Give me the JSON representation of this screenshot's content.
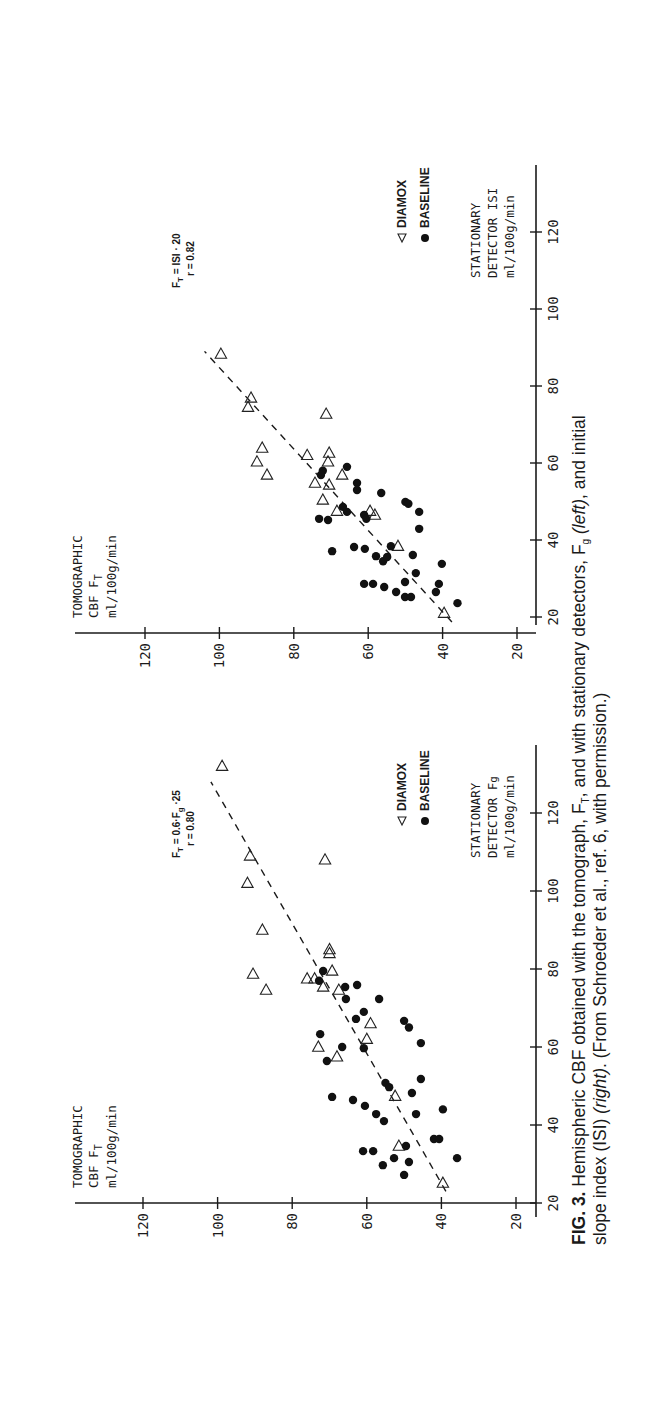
{
  "caption": {
    "fig_label": "FIG. 3.",
    "line1_a": " Hemispheric CBF obtained with the tomograph, F",
    "line1_sub_T": "T",
    "line1_b": ", and with stationary detectors, F",
    "line1_sub_g": "g",
    "line1_c": " ",
    "line1_left": "(left)",
    "line1_d": ", and initial",
    "line2_a": "slope index (ISI) ",
    "line2_right": "(right)",
    "line2_b": ". (From Schroeder et al., ref. 6, with permission.)"
  },
  "chart_data": [
    {
      "type": "scatter",
      "panel": "left",
      "title": "",
      "ylabel_lines": [
        "TOMOGRAPHIC",
        "CBF    FT",
        "ml/100g/min"
      ],
      "xlabel_lines": [
        "STATIONARY",
        "DETECTOR Fg",
        "ml/100g/min"
      ],
      "xticks": [
        20,
        40,
        60,
        80,
        100,
        120
      ],
      "yticks": [
        20,
        40,
        60,
        80,
        100,
        120
      ],
      "xlim": [
        18,
        140
      ],
      "ylim": [
        18,
        138
      ],
      "annotation": {
        "line1": "FT = 0.6·Fg + 25",
        "line2": "r = 0.80"
      },
      "legend": [
        {
          "marker": "triangle",
          "label": "DIAMOX"
        },
        {
          "marker": "circle",
          "label": "BASELINE"
        }
      ],
      "fit_line": {
        "x": [
          23,
          128
        ],
        "y": [
          38.8,
          101.8
        ],
        "style": "dashed"
      },
      "series": [
        {
          "name": "DIAMOX",
          "marker": "open-triangle",
          "points": [
            [
              132,
              98.8
            ],
            [
              109,
              91.3
            ],
            [
              108,
              71.2
            ],
            [
              102,
              92
            ],
            [
              90,
              88
            ],
            [
              85,
              70
            ],
            [
              84,
              70
            ],
            [
              78.7,
              90.5
            ],
            [
              74.6,
              87
            ],
            [
              79.5,
              69.3
            ],
            [
              77.5,
              76
            ],
            [
              77.5,
              74
            ],
            [
              75.4,
              71.7
            ],
            [
              74.6,
              67.5
            ],
            [
              66,
              59
            ],
            [
              62,
              60
            ],
            [
              60,
              73
            ],
            [
              57.5,
              68
            ],
            [
              47.4,
              52.4
            ],
            [
              34.6,
              51.4
            ],
            [
              25.1,
              39.6
            ]
          ]
        },
        {
          "name": "BASELINE",
          "marker": "filled-circle",
          "points": [
            [
              79.5,
              71.7
            ],
            [
              77,
              72.8
            ],
            [
              75.4,
              65.8
            ],
            [
              75.9,
              62.6
            ],
            [
              72.3,
              65.6
            ],
            [
              72.3,
              56.7
            ],
            [
              69,
              60.8
            ],
            [
              67.2,
              62.9
            ],
            [
              66.7,
              50
            ],
            [
              65,
              48.7
            ],
            [
              63.3,
              72.5
            ],
            [
              60,
              66.6
            ],
            [
              59.7,
              60.8
            ],
            [
              56.4,
              70.7
            ],
            [
              50.8,
              55
            ],
            [
              49.7,
              54
            ],
            [
              61,
              45.5
            ],
            [
              51.8,
              45.5
            ],
            [
              48.2,
              47.9
            ],
            [
              47.2,
              69.3
            ],
            [
              46.4,
              63.7
            ],
            [
              44.9,
              60.5
            ],
            [
              42.8,
              57.5
            ],
            [
              41,
              55.4
            ],
            [
              42.8,
              46.8
            ],
            [
              44,
              39.6
            ],
            [
              36.4,
              42
            ],
            [
              36.4,
              40.6
            ],
            [
              33.3,
              61
            ],
            [
              33.3,
              58.3
            ],
            [
              34.6,
              49.5
            ],
            [
              31.5,
              52.7
            ],
            [
              30.5,
              48.7
            ],
            [
              29.7,
              55.7
            ],
            [
              27.2,
              50
            ],
            [
              31.5,
              35.8
            ]
          ]
        }
      ]
    },
    {
      "type": "scatter",
      "panel": "right",
      "title": "",
      "ylabel_lines": [
        "TOMOGRAPHIC",
        "CBF    FT",
        "ml/100g/min"
      ],
      "xlabel_lines": [
        "STATIONARY",
        "DETECTOR ISI",
        "ml/100g/min"
      ],
      "xticks": [
        20,
        40,
        60,
        80,
        100,
        120
      ],
      "yticks": [
        20,
        40,
        60,
        80,
        100,
        120
      ],
      "xlim": [
        18,
        138
      ],
      "ylim": [
        18,
        138
      ],
      "annotation": {
        "line1": "FT = ISI + 20",
        "line2": "r = 0.82"
      },
      "legend": [
        {
          "marker": "triangle",
          "label": "DIAMOX"
        },
        {
          "marker": "circle",
          "label": "BASELINE"
        }
      ],
      "fit_line": {
        "x": [
          18.7,
          89
        ],
        "y": [
          37.5,
          104
        ],
        "style": "dashed"
      },
      "series": [
        {
          "name": "DIAMOX",
          "marker": "open-triangle",
          "points": [
            [
              88.3,
              99.6
            ],
            [
              76.9,
              91.5
            ],
            [
              74.5,
              92.3
            ],
            [
              72.7,
              71.3
            ],
            [
              63.9,
              88.5
            ],
            [
              60.3,
              89.9
            ],
            [
              56.9,
              87.2
            ],
            [
              62,
              76.4
            ],
            [
              62.6,
              70.5
            ],
            [
              60.3,
              70.8
            ],
            [
              56.9,
              67
            ],
            [
              54.8,
              74.3
            ],
            [
              54.3,
              70.5
            ],
            [
              50.4,
              72.2
            ],
            [
              47.5,
              68.4
            ],
            [
              47.5,
              59.5
            ],
            [
              46.5,
              58.2
            ],
            [
              38.4,
              52
            ],
            [
              21,
              39.6
            ]
          ]
        },
        {
          "name": "BASELINE",
          "marker": "filled-circle",
          "points": [
            [
              59,
              65.7
            ],
            [
              58,
              72.2
            ],
            [
              56.9,
              72.7
            ],
            [
              54.8,
              63
            ],
            [
              53,
              63
            ],
            [
              52.2,
              56.5
            ],
            [
              49.9,
              50
            ],
            [
              49.4,
              49.2
            ],
            [
              47.3,
              46.3
            ],
            [
              42.9,
              46.3
            ],
            [
              48.6,
              66.8
            ],
            [
              47.3,
              65.7
            ],
            [
              45.5,
              73.2
            ],
            [
              45.2,
              70.8
            ],
            [
              46.5,
              61.1
            ],
            [
              45.5,
              60.5
            ],
            [
              37.1,
              69.7
            ],
            [
              38.2,
              63.8
            ],
            [
              37.7,
              60.9
            ],
            [
              38.4,
              53.9
            ],
            [
              35.8,
              57.9
            ],
            [
              34.5,
              56
            ],
            [
              35.6,
              54.9
            ],
            [
              36.1,
              48
            ],
            [
              33.8,
              40.2
            ],
            [
              31.4,
              47.2
            ],
            [
              28.6,
              61.1
            ],
            [
              28.6,
              58.7
            ],
            [
              27.8,
              55.7
            ],
            [
              29.1,
              50.1
            ],
            [
              26.5,
              52.5
            ],
            [
              25.2,
              50.1
            ],
            [
              25.2,
              48.5
            ],
            [
              28.6,
              41
            ],
            [
              26.5,
              41.8
            ],
            [
              23.6,
              36
            ]
          ]
        }
      ]
    }
  ]
}
